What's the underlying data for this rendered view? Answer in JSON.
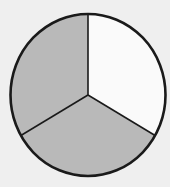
{
  "diagram": {
    "type": "fraction-circle",
    "total_parts": 3,
    "shaded_parts": 2,
    "fraction": "2/3",
    "center": [
      88,
      95
    ],
    "radius_x": 77.5,
    "radius_y": 81,
    "start_angle_deg": -90,
    "colors": {
      "background": "#efefef",
      "shaded": "#b9b9b9",
      "unshaded": "#fafafa",
      "stroke": "#1a1a1a"
    },
    "sectors": [
      {
        "index": 0,
        "label": "top-right sector",
        "shaded": false
      },
      {
        "index": 1,
        "label": "bottom sector",
        "shaded": true
      },
      {
        "index": 2,
        "label": "top-left sector",
        "shaded": true
      }
    ]
  }
}
